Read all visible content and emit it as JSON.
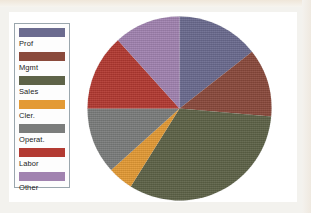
{
  "figure": {
    "background_color": "#ffffff",
    "page_background_color": "#f3f2ee"
  },
  "legend": {
    "name": "legend",
    "border_color": "#9aa6ad",
    "items": [
      {
        "label": "Prof",
        "color": "#6b6b8f"
      },
      {
        "label": "Mgmt",
        "color": "#8a4a3c"
      },
      {
        "label": "Sales",
        "color": "#5e6348"
      },
      {
        "label": "Cler.",
        "color": "#e39a35"
      },
      {
        "label": "Operat.",
        "color": "#7b7d7c"
      },
      {
        "label": "Labor",
        "color": "#b33a32"
      },
      {
        "label": "Other",
        "color": "#a183b0"
      }
    ]
  },
  "chart_data": {
    "type": "pie",
    "title": "",
    "xlabel": "",
    "ylabel": "",
    "legend_position": "left",
    "start_angle_deg": 0,
    "direction": "clockwise",
    "categories": [
      "Prof",
      "Mgmt",
      "Sales",
      "Cler.",
      "Operat.",
      "Labor",
      "Other"
    ],
    "values": [
      14.4,
      11.9,
      32.5,
      4.4,
      11.7,
      13.3,
      11.8
    ],
    "unit": "percent",
    "colors": [
      "#6b6b8f",
      "#8a4a3c",
      "#5e6348",
      "#e39a35",
      "#7b7d7c",
      "#b33a32",
      "#a183b0"
    ],
    "slice_angles_deg": [
      {
        "name": "Prof",
        "start": 0,
        "end": 52
      },
      {
        "name": "Mgmt",
        "start": 52,
        "end": 95
      },
      {
        "name": "Sales",
        "start": 95,
        "end": 212
      },
      {
        "name": "Cler.",
        "start": 212,
        "end": 228
      },
      {
        "name": "Operat.",
        "start": 228,
        "end": 270
      },
      {
        "name": "Labor",
        "start": 270,
        "end": 318
      },
      {
        "name": "Other",
        "start": 318,
        "end": 360
      }
    ]
  }
}
